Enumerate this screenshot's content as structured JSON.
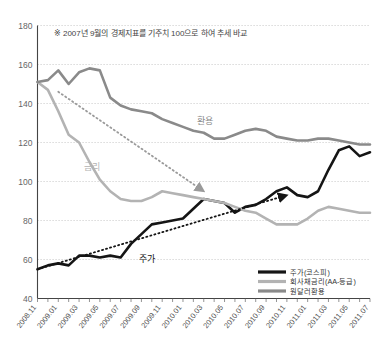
{
  "chart_data": {
    "type": "line",
    "title": "",
    "note": "※ 2007년 9월의 경제지표를 기주치 100으로 하여 추세 바교",
    "xlabel": "",
    "ylabel": "",
    "ylim": [
      40,
      180
    ],
    "ytick_values": [
      40,
      60,
      80,
      100,
      120,
      140,
      160,
      180
    ],
    "ytick_labels": [
      "40",
      "60",
      "80",
      "100",
      "120",
      "140",
      "160",
      "180"
    ],
    "grid": true,
    "legend_position": "bottom-right",
    "x": [
      "2008.11",
      "2008.12",
      "2009.01",
      "2009.02",
      "2009.03",
      "2009.04",
      "2009.05",
      "2009.06",
      "2009.07",
      "2009.08",
      "2009.09",
      "2009.10",
      "2009.11",
      "2009.12",
      "2010.01",
      "2010.02",
      "2010.03",
      "2010.04",
      "2010.05",
      "2010.06",
      "2010.07",
      "2010.08",
      "2010.09",
      "2010.10",
      "2010.11",
      "2010.12",
      "2011.01",
      "2011.02",
      "2011.03",
      "2011.04",
      "2011.05",
      "2011.06",
      "2011.07"
    ],
    "xtick_labels": [
      "2008.11",
      "2009.01",
      "2009.03",
      "2009.05",
      "2009.07",
      "2009.09",
      "2009.11",
      "2010.01",
      "2010.03",
      "2010.05",
      "2010.07",
      "2010.09",
      "2010.11",
      "2011.01",
      "2011.03",
      "2011.05",
      "2011.07"
    ],
    "series": [
      {
        "name": "주가(코스피)",
        "color": "#151515",
        "width": 2.6,
        "inline_label": "주가",
        "values": [
          55,
          57,
          58,
          57,
          62,
          62,
          61,
          62,
          61,
          68,
          73,
          78,
          79,
          80,
          81,
          86,
          91,
          90,
          89,
          84,
          87,
          88,
          91,
          95,
          97,
          93,
          92,
          95,
          106,
          116,
          118,
          113,
          115
        ]
      },
      {
        "name": "회사채금리(AA-등급)",
        "color": "#b3b3b3",
        "width": 2.6,
        "inline_label": "금리",
        "values": [
          151,
          147,
          136,
          124,
          120,
          110,
          101,
          95,
          91,
          90,
          90,
          92,
          95,
          94,
          93,
          92,
          91,
          90,
          89,
          87,
          85,
          84,
          81,
          78,
          78,
          78,
          81,
          85,
          87,
          86,
          85,
          84,
          84
        ]
      },
      {
        "name": "원달러환용",
        "color": "#8a8a8a",
        "width": 2.6,
        "inline_label": "환용",
        "values": [
          151,
          152,
          157,
          150,
          156,
          158,
          157,
          143,
          139,
          137,
          136,
          135,
          132,
          130,
          128,
          126,
          125,
          122,
          122,
          124,
          126,
          127,
          126,
          123,
          122,
          121,
          121,
          122,
          122,
          121,
          120,
          119,
          119
        ]
      }
    ],
    "trend_arrows": [
      {
        "name": "interest-rate-trend",
        "x_from": "2009.01",
        "y_from": 146,
        "x_to": "2010.03",
        "y_to": 95,
        "style": "dotted",
        "color": "#9a9a9a"
      },
      {
        "name": "stock-price-trend",
        "x_from": "2008.11",
        "y_from": 55,
        "x_to": "2010.11",
        "y_to": 93,
        "style": "dotted",
        "color": "#151515"
      }
    ]
  }
}
